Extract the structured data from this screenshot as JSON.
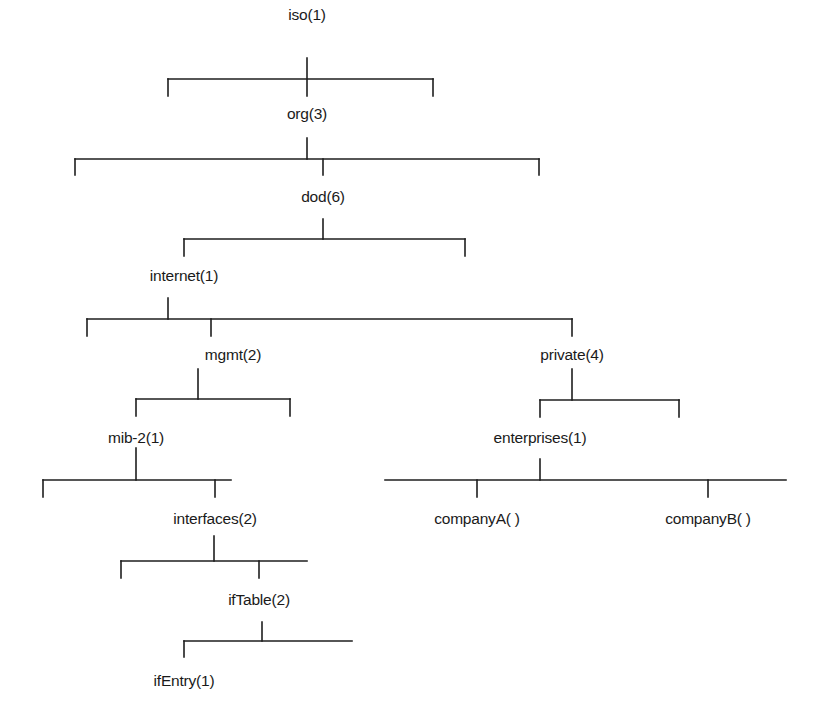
{
  "diagram": {
    "type": "tree",
    "colors": {
      "line": "#1e1e1e",
      "text": "#1a1a1a",
      "background": "#ffffff"
    },
    "nodes": [
      {
        "id": "iso",
        "label": "iso(1)",
        "x": 307,
        "y": 15
      },
      {
        "id": "org",
        "label": "org(3)",
        "x": 307,
        "y": 114
      },
      {
        "id": "dod",
        "label": "dod(6)",
        "x": 323,
        "y": 197
      },
      {
        "id": "internet",
        "label": "internet(1)",
        "x": 184,
        "y": 276
      },
      {
        "id": "mgmt",
        "label": "mgmt(2)",
        "x": 233,
        "y": 355
      },
      {
        "id": "private",
        "label": "private(4)",
        "x": 572,
        "y": 355
      },
      {
        "id": "mib2",
        "label": "mib-2(1)",
        "x": 136,
        "y": 438
      },
      {
        "id": "enterprises",
        "label": "enterprises(1)",
        "x": 540,
        "y": 438
      },
      {
        "id": "interfaces",
        "label": "interfaces(2)",
        "x": 215,
        "y": 519
      },
      {
        "id": "companyA",
        "label": "companyA( )",
        "x": 477,
        "y": 519
      },
      {
        "id": "companyB",
        "label": "companyB( )",
        "x": 708,
        "y": 519
      },
      {
        "id": "ifTable",
        "label": "ifTable(2)",
        "x": 259,
        "y": 600
      },
      {
        "id": "ifEntry",
        "label": "ifEntry(1)",
        "x": 184,
        "y": 681
      }
    ],
    "edges": [
      {
        "from": "iso",
        "to": "org"
      },
      {
        "from": "org",
        "to": "dod"
      },
      {
        "from": "dod",
        "to": "internet"
      },
      {
        "from": "internet",
        "to": "mgmt"
      },
      {
        "from": "internet",
        "to": "private"
      },
      {
        "from": "mgmt",
        "to": "mib2"
      },
      {
        "from": "private",
        "to": "enterprises"
      },
      {
        "from": "mib2",
        "to": "interfaces"
      },
      {
        "from": "enterprises",
        "to": "companyA"
      },
      {
        "from": "enterprises",
        "to": "companyB"
      },
      {
        "from": "interfaces",
        "to": "ifTable"
      },
      {
        "from": "ifTable",
        "to": "ifEntry"
      }
    ]
  }
}
